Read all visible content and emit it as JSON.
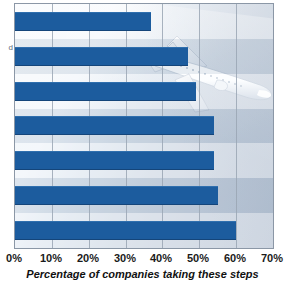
{
  "chart_data": {
    "type": "bar",
    "orientation": "horizontal",
    "title": "",
    "subtitle": "",
    "xlabel": "Percentage of companies taking these steps",
    "ylabel": "",
    "xlim": [
      0,
      70
    ],
    "xtick_labels": [
      "0%",
      "10%",
      "20%",
      "30%",
      "40%",
      "50%",
      "60%",
      "70%"
    ],
    "xtick_values": [
      0,
      10,
      20,
      30,
      40,
      50,
      60,
      70
    ],
    "grid": true,
    "legend": null,
    "categories": [
      "",
      "",
      "",
      "",
      "",
      "",
      ""
    ],
    "values": [
      37,
      47,
      49,
      54,
      54,
      55,
      60
    ],
    "series": [
      {
        "name": "Percentage of companies taking these steps",
        "values": [
          37,
          47,
          49,
          54,
          54,
          55,
          60
        ]
      }
    ],
    "bar_color": "#1c5c9e",
    "annotations": [
      "airplane watermark image in plot background"
    ]
  },
  "axis": {
    "left_label_fragment": "d"
  },
  "colors": {
    "bar": "#1c5c9e",
    "bar_top_highlight": "#2f6fae",
    "bar_bottom_shadow": "#14457a",
    "gridline": "#9aa6b4",
    "plot_border": "#8b97a6",
    "band_light": "#eff4f9",
    "band_dark": "#ccd6e2",
    "text": "#111111",
    "page_background": "#ffffff"
  },
  "icons": {
    "airplane": "airplane-icon"
  }
}
